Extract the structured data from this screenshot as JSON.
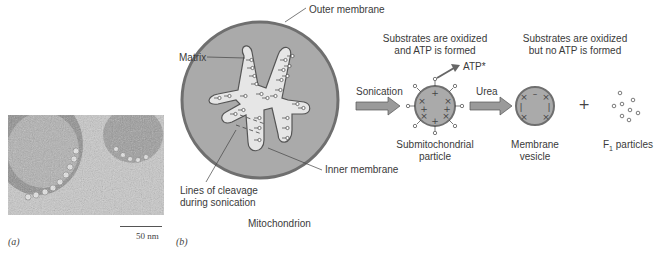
{
  "panel_a": {
    "label": "(a)",
    "scale_bar": "50 nm"
  },
  "panel_b": {
    "label": "(b)",
    "mitochondrion": {
      "title": "Mitochondrion",
      "outer_membrane": "Outer membrane",
      "matrix": "Matrix",
      "inner_membrane": "Inner membrane",
      "cleavage_line1": "Lines of cleavage",
      "cleavage_line2": "during sonication"
    },
    "step1": {
      "arrow_label": "Sonication",
      "caption_line1": "Substrates are oxidized",
      "caption_line2": "and ATP is formed",
      "atp": "ATP*",
      "product_line1": "Submitochondrial",
      "product_line2": "particle"
    },
    "step2": {
      "arrow_label": "Urea",
      "caption_line1": "Substrates are oxidized",
      "caption_line2": "but no ATP is formed",
      "product_line1": "Membrane",
      "product_line2": "vesicle",
      "plus": "+",
      "f1_prefix": "F",
      "f1_sub": "1",
      "f1_suffix": " particles"
    }
  },
  "colors": {
    "membrane_fill": "#aaaaaa",
    "membrane_stroke": "#6f6f6f",
    "matrix_fill": "#e6e6e6",
    "arrow_fill": "#9a9a9a"
  }
}
